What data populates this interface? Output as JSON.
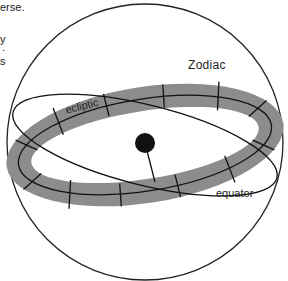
{
  "caption": {
    "line1": "erse.",
    "line2": "",
    "line3": "y",
    "line4": ".",
    "line5": "s"
  },
  "labels": {
    "zodiac": "Zodiac",
    "ecliptic": "ecliptic",
    "equator": "equator"
  },
  "colors": {
    "band": "#8c8c8c",
    "line": "#111111",
    "earth": "#111111",
    "background": "#ffffff"
  },
  "elements": [
    "celestial-sphere",
    "zodiac-band",
    "ecliptic-line",
    "celestial-equator",
    "earth",
    "earth-axis"
  ]
}
